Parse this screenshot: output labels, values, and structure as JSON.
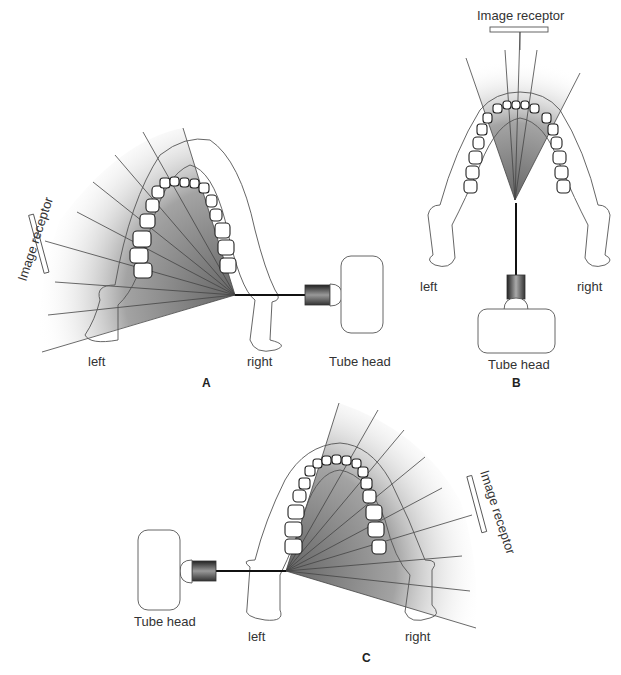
{
  "figure": {
    "panels": [
      {
        "id": "A",
        "label": "A",
        "side_left": "left",
        "side_right": "right",
        "tube_head": "Tube head",
        "image_receptor": "Image receptor"
      },
      {
        "id": "B",
        "label": "B",
        "side_left": "left",
        "side_right": "right",
        "tube_head": "Tube head",
        "image_receptor": "Image receptor"
      },
      {
        "id": "C",
        "label": "C",
        "side_left": "left",
        "side_right": "right",
        "tube_head": "Tube head",
        "image_receptor": "Image receptor"
      }
    ],
    "colors": {
      "beam_shade": "#6e6e6e",
      "line": "#333333",
      "background": "#ffffff"
    }
  }
}
